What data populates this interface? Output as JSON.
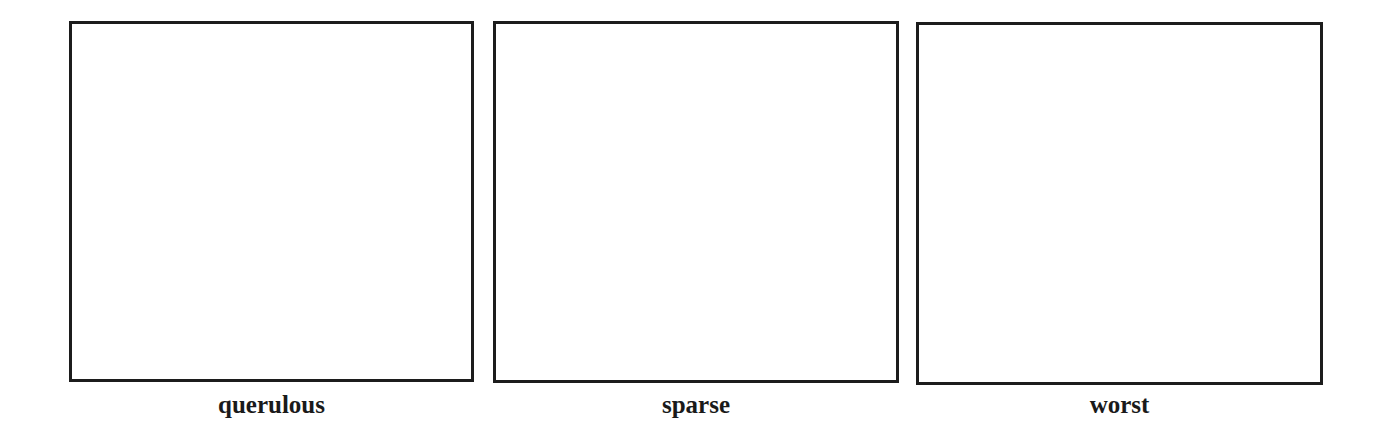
{
  "panels": [
    {
      "label": "querulous",
      "content": ""
    },
    {
      "label": "sparse",
      "content": ""
    },
    {
      "label": "worst",
      "content": ""
    }
  ],
  "colors": {
    "background": "#ffffff",
    "border": "#1c1c1c",
    "text": "#1a1a1a"
  }
}
